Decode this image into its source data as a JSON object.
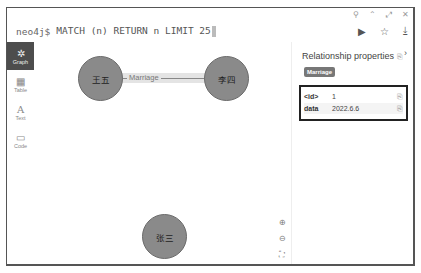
{
  "window": {
    "controls": [
      "pin-icon",
      "collapse-icon",
      "expand-icon",
      "close-icon"
    ]
  },
  "editor": {
    "prompt": "neo4j$",
    "query": "MATCH (n) RETURN n LIMIT 25",
    "actions": [
      "run-icon",
      "favorite-icon",
      "download-icon"
    ]
  },
  "sidebar": {
    "items": [
      {
        "label": "Graph",
        "icon": "✲",
        "active": true
      },
      {
        "label": "Table",
        "icon": "▦",
        "active": false
      },
      {
        "label": "Text",
        "icon": "A",
        "active": false
      },
      {
        "label": "Code",
        "icon": "▭",
        "active": false
      }
    ]
  },
  "graph": {
    "nodes": [
      {
        "label": "王五"
      },
      {
        "label": "李四"
      },
      {
        "label": "张三"
      }
    ],
    "relationship": {
      "type": "Marriage",
      "from": "李四",
      "to": "王五"
    },
    "zoom_controls": [
      "zoom-in-icon",
      "zoom-out-icon",
      "fit-icon"
    ]
  },
  "panel": {
    "title": "Relationship properties",
    "badge": "Marriage",
    "properties": [
      {
        "key": "<id>",
        "value": "1"
      },
      {
        "key": "data",
        "value": "2022.6.6"
      }
    ]
  }
}
